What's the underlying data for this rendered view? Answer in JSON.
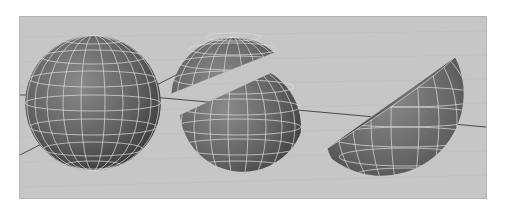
{
  "viewport": {
    "label": "3D perspective viewport",
    "background_color": "#c6c6c6",
    "grid_line_color": "#bcbcbc",
    "axis_line_color": "#4a4a4a"
  },
  "objects": [
    {
      "name": "sphere-full",
      "description": "Complete polygon sphere"
    },
    {
      "name": "sphere-sliced",
      "description": "Sphere cut diagonally into two pieces with a gap"
    },
    {
      "name": "sphere-half-bowl",
      "description": "Half sphere opened showing interior"
    }
  ],
  "colors": {
    "surface": "#6c6c6c",
    "surface_dark": "#3e3e3e",
    "surface_light": "#8a8a8a",
    "wireframe": "#dedede",
    "interior": "#5a5a5a"
  }
}
